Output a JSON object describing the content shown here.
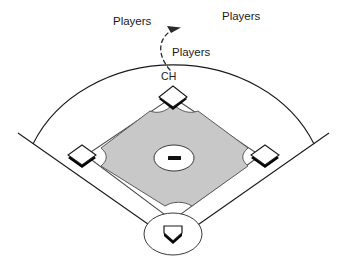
{
  "diagram": {
    "labels": {
      "players_left": "Players",
      "players_right": "Players",
      "players_mid": "Players",
      "ch": "CH"
    },
    "colors": {
      "infield_fill": "#c8c8c8",
      "infield_stroke": "#5a5a5a",
      "line": "#1a1a1a",
      "base_fill": "#ffffff",
      "base_shadow": "#000000",
      "background": "#ffffff"
    },
    "elements": [
      {
        "name": "outfield-arc",
        "kind": "arc",
        "description": "outfield fence arc"
      },
      {
        "name": "foul-line-left",
        "kind": "line",
        "description": "left foul line"
      },
      {
        "name": "foul-line-right",
        "kind": "line",
        "description": "right foul line"
      },
      {
        "name": "infield-diamond",
        "kind": "polygon",
        "description": "shaded infield with scalloped base cutouts"
      },
      {
        "name": "baseline-path",
        "kind": "outline",
        "description": "thin baseline channel around infield"
      },
      {
        "name": "pitchers-mound",
        "kind": "ellipse",
        "description": "pitcher's mound circle"
      },
      {
        "name": "pitchers-rubber",
        "kind": "rect",
        "description": "pitching rubber"
      },
      {
        "name": "second-base",
        "kind": "diamond",
        "description": "second base"
      },
      {
        "name": "third-base",
        "kind": "diamond",
        "description": "third base"
      },
      {
        "name": "first-base",
        "kind": "diamond",
        "description": "first base"
      },
      {
        "name": "home-plate",
        "kind": "plate",
        "description": "home plate"
      },
      {
        "name": "home-plate-circle",
        "kind": "ellipse",
        "description": "home plate dirt circle"
      },
      {
        "name": "movement-arrow",
        "kind": "dashed-arrow",
        "description": "curved dashed arrow from CH toward upper right"
      }
    ]
  }
}
